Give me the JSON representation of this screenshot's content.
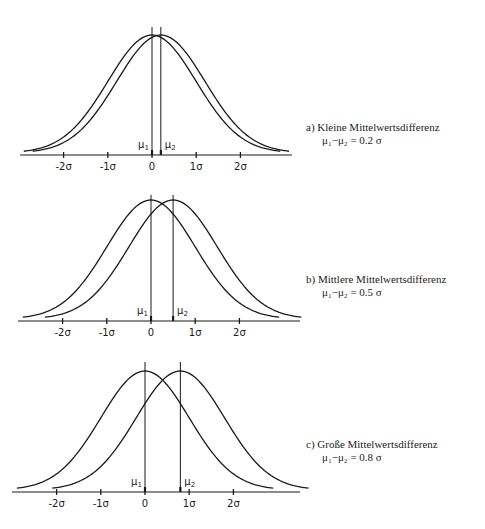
{
  "chart_data": [
    {
      "type": "line",
      "title": "a) Kleine Mittelwertsdifferenz",
      "subtitle": "μ₁−μ₂ = 0.2 σ",
      "xlabel": "",
      "ylabel": "",
      "x_tick_labels": [
        "-2σ",
        "-1σ",
        "0",
        "1σ",
        "2σ"
      ],
      "x_ticks": [
        -2,
        -1,
        0,
        1,
        2
      ],
      "xlim": [
        -3.0,
        3.2
      ],
      "grid": false,
      "series": [
        {
          "name": "μ1",
          "distribution": "normal",
          "mean": 0,
          "sd": 1,
          "label": "μ1"
        },
        {
          "name": "μ2",
          "distribution": "normal",
          "mean": 0.2,
          "sd": 1,
          "label": "μ2"
        }
      ]
    },
    {
      "type": "line",
      "title": "b) Mittlere Mittelwertsdifferenz",
      "subtitle": "μ₁−μ₂ = 0.5 σ",
      "xlabel": "",
      "ylabel": "",
      "x_tick_labels": [
        "-2σ",
        "-1σ",
        "0",
        "1σ",
        "2σ"
      ],
      "x_ticks": [
        -2,
        -1,
        0,
        1,
        2
      ],
      "xlim": [
        -3.0,
        3.4
      ],
      "grid": false,
      "series": [
        {
          "name": "μ1",
          "distribution": "normal",
          "mean": 0,
          "sd": 1,
          "label": "μ1"
        },
        {
          "name": "μ2",
          "distribution": "normal",
          "mean": 0.5,
          "sd": 1,
          "label": "μ2"
        }
      ]
    },
    {
      "type": "line",
      "title": "c) Große Mittelwertsdifferenz",
      "subtitle": "μ₁−μ₂ = 0.8 σ",
      "xlabel": "",
      "ylabel": "",
      "x_tick_labels": [
        "-2σ",
        "-1σ",
        "0",
        "1σ",
        "2σ"
      ],
      "x_ticks": [
        -2,
        -1,
        0,
        1,
        2
      ],
      "xlim": [
        -3.0,
        3.5
      ],
      "grid": false,
      "series": [
        {
          "name": "μ1",
          "distribution": "normal",
          "mean": 0,
          "sd": 1,
          "label": "μ1"
        },
        {
          "name": "μ2",
          "distribution": "normal",
          "mean": 0.8,
          "sd": 1,
          "label": "μ2"
        }
      ]
    }
  ],
  "captions": [
    {
      "line1": "a)  Kleine Mittelwertsdifferenz",
      "line2": "μ₁−μ₂ = 0.2 σ"
    },
    {
      "line1": "b)  Mittlere Mittelwertsdifferenz",
      "line2": "μ₁−μ₂ = 0.5 σ"
    },
    {
      "line1": "c)  Große Mittelwertsdifferenz",
      "line2": "μ₁−μ₂ = 0.8 σ"
    }
  ]
}
